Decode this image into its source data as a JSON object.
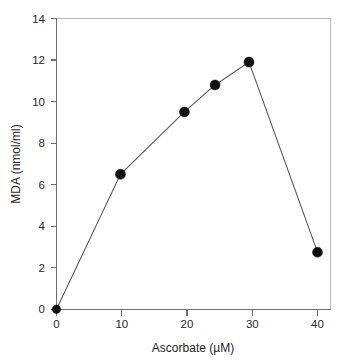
{
  "chart_data": {
    "type": "line",
    "title": "",
    "subtitle": "",
    "xlabel": "Ascorbate (µM)",
    "ylabel": "MDA (nmol/ml)",
    "xlim": [
      0,
      45
    ],
    "ylim": [
      0,
      14
    ],
    "xticks": [
      0,
      10,
      20,
      30,
      40
    ],
    "xtick_labels": [
      "0",
      "10",
      "20",
      "30",
      "40"
    ],
    "yticks": [
      0,
      2,
      4,
      6,
      8,
      10,
      12,
      14
    ],
    "ytick_labels": [
      "0",
      "2",
      "4",
      "6",
      "8",
      "10",
      "12",
      "14"
    ],
    "grid": false,
    "legend": false,
    "legend_position": "none",
    "marker": "filled-circle",
    "marker_color": "#111111",
    "line_color": "#555555",
    "x": [
      0,
      9.8,
      19.6,
      24.3,
      29.5,
      40.0
    ],
    "y": [
      0.0,
      6.5,
      9.5,
      10.8,
      11.9,
      2.75
    ],
    "series": [
      {
        "name": "MDA",
        "points": [
          {
            "x": 0,
            "y": 0.0
          },
          {
            "x": 9.8,
            "y": 6.5
          },
          {
            "x": 19.6,
            "y": 9.5
          },
          {
            "x": 24.3,
            "y": 10.8
          },
          {
            "x": 29.5,
            "y": 11.9
          },
          {
            "x": 40.0,
            "y": 2.75
          }
        ]
      }
    ],
    "annotations": []
  },
  "figure": {
    "background_color": "#ffffff",
    "axis_color": "#6e6e6e",
    "frame_color": "#b9b9b9",
    "text_color": "#1f1f1f"
  }
}
